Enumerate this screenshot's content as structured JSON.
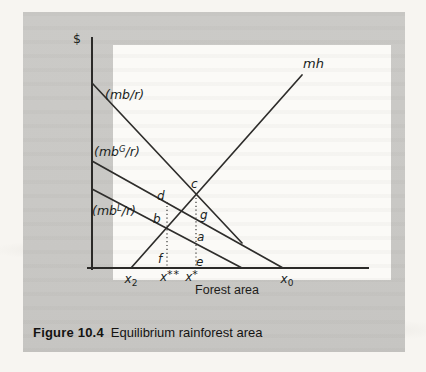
{
  "figure": {
    "caption_number": "Figure 10.4",
    "caption_title": "Equilibrium rainforest area"
  },
  "axis_labels": {
    "y": "$",
    "x": "Forest area"
  },
  "curve_labels": {
    "mb_total": "(mb/r)",
    "mb_global": {
      "pre": "(mb",
      "sup": "G",
      "post": "/r)"
    },
    "mb_local": {
      "pre": "(mb",
      "sup": "L",
      "post": "/r)"
    },
    "mh": "mh"
  },
  "ticks": {
    "x2": {
      "base": "x",
      "sub": "2"
    },
    "xstarstar": {
      "base": "x",
      "sup": "**"
    },
    "xstar": {
      "base": "x",
      "sup": "*"
    },
    "x0": {
      "base": "x",
      "sub": "0"
    }
  },
  "point_labels": {
    "c": "c",
    "d": "d",
    "b": "b",
    "g": "g",
    "a": "a",
    "f": "f",
    "e": "e"
  },
  "colors": {
    "page": "#f7f5f1",
    "panel": "#c9c8c5",
    "plot": "#fbfaf7",
    "ink": "#2e2d2b"
  },
  "chart_data": {
    "type": "line",
    "title": "Equilibrium rainforest area",
    "xlabel": "Forest area",
    "ylabel": "$",
    "numeric_axes": false,
    "axis_px": {
      "origin_x": 92,
      "origin_y": 268,
      "x_end": 368,
      "y_top": 38,
      "x_left_overhang": 88
    },
    "lines": [
      {
        "name": "mh",
        "pts": [
          [
            131,
            268
          ],
          [
            302,
            75
          ]
        ],
        "style": "solid"
      },
      {
        "name": "mb_over_r",
        "pts": [
          [
            92,
            83
          ],
          [
            242,
            243
          ]
        ],
        "style": "solid"
      },
      {
        "name": "mbG_over_r",
        "pts": [
          [
            92,
            161
          ],
          [
            283,
            268
          ]
        ],
        "style": "solid"
      },
      {
        "name": "mbL_over_r",
        "pts": [
          [
            92,
            189
          ],
          [
            242,
            268
          ]
        ],
        "style": "solid"
      },
      {
        "name": "guide_xstarstar",
        "pts": [
          [
            167,
            202
          ],
          [
            167,
            268
          ]
        ],
        "style": "dotted"
      },
      {
        "name": "guide_xstar",
        "pts": [
          [
            196,
            194
          ],
          [
            196,
            268
          ]
        ],
        "style": "dotted"
      }
    ],
    "points": [
      {
        "label": "c",
        "x": 196,
        "y": 194
      },
      {
        "label": "d",
        "x": 167,
        "y": 203
      },
      {
        "label": "b",
        "x": 166,
        "y": 228
      },
      {
        "label": "g",
        "x": 196,
        "y": 219
      },
      {
        "label": "a",
        "x": 196,
        "y": 244
      },
      {
        "label": "f",
        "x": 163,
        "y": 265
      },
      {
        "label": "e",
        "x": 199,
        "y": 265
      }
    ],
    "x_ticks": [
      {
        "label": "x2",
        "x": 131
      },
      {
        "label": "x**",
        "x": 170
      },
      {
        "label": "x*",
        "x": 192
      },
      {
        "label": "x0",
        "x": 287
      }
    ]
  }
}
